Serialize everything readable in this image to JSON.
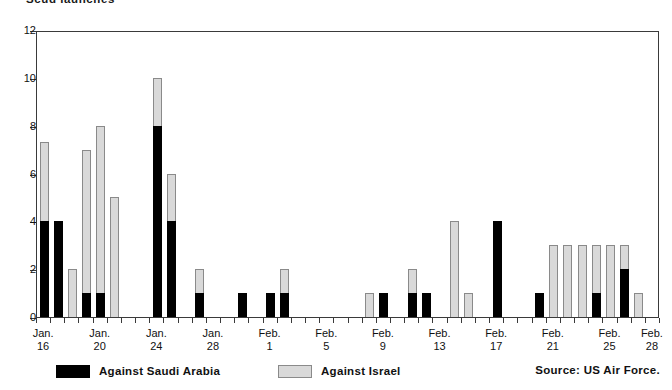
{
  "chart_data": {
    "type": "bar",
    "title": "Scud launches",
    "subtitle": "",
    "xlabel": "",
    "ylabel": "",
    "ylim": [
      0,
      12
    ],
    "ytick_labels": [
      "0",
      "2",
      "4",
      "6",
      "8",
      "10",
      "12"
    ],
    "yticks": [
      0,
      2,
      4,
      6,
      8,
      10,
      12
    ],
    "grid": false,
    "stacked": true,
    "legend_position": "bottom-left",
    "source": "Source: US Air Force.",
    "legend": [
      {
        "name": "Against Saudi Arabia",
        "color": "#000000"
      },
      {
        "name": "Against Israel",
        "color": "#d9d9d9"
      }
    ],
    "categories": [
      "Jan. 16",
      "Jan. 17",
      "Jan. 18",
      "Jan. 19",
      "Jan. 20",
      "Jan. 21",
      "Jan. 22",
      "Jan. 23",
      "Jan. 24",
      "Jan. 25",
      "Jan. 26",
      "Jan. 27",
      "Jan. 28",
      "Jan. 29",
      "Jan. 30",
      "Jan. 31",
      "Feb. 1",
      "Feb. 2",
      "Feb. 3",
      "Feb. 4",
      "Feb. 5",
      "Feb. 6",
      "Feb. 7",
      "Feb. 8",
      "Feb. 9",
      "Feb. 10",
      "Feb. 11",
      "Feb. 12",
      "Feb. 13",
      "Feb. 14",
      "Feb. 15",
      "Feb. 16",
      "Feb. 17",
      "Feb. 18",
      "Feb. 19",
      "Feb. 20",
      "Feb. 21",
      "Feb. 22",
      "Feb. 23",
      "Feb. 24",
      "Feb. 25",
      "Feb. 26",
      "Feb. 27",
      "Feb. 28"
    ],
    "axis_tick_labels": [
      {
        "line1": "Jan.",
        "line2": "16",
        "index": 0
      },
      {
        "line1": "Jan.",
        "line2": "20",
        "index": 4
      },
      {
        "line1": "Jan.",
        "line2": "24",
        "index": 8
      },
      {
        "line1": "Jan.",
        "line2": "28",
        "index": 12
      },
      {
        "line1": "Feb.",
        "line2": "1",
        "index": 16
      },
      {
        "line1": "Feb.",
        "line2": "5",
        "index": 20
      },
      {
        "line1": "Feb.",
        "line2": "9",
        "index": 24
      },
      {
        "line1": "Feb.",
        "line2": "13",
        "index": 28
      },
      {
        "line1": "Feb.",
        "line2": "17",
        "index": 32
      },
      {
        "line1": "Feb.",
        "line2": "21",
        "index": 36
      },
      {
        "line1": "Feb.",
        "line2": "25",
        "index": 40
      },
      {
        "line1": "Feb.",
        "line2": "28",
        "index": 43
      }
    ],
    "series": [
      {
        "name": "Against Saudi Arabia",
        "color": "#000000",
        "values": [
          4,
          4,
          0,
          1,
          1,
          0,
          0,
          0,
          8,
          4,
          0,
          1,
          0,
          0,
          1,
          0,
          1,
          1,
          0,
          0,
          0,
          0,
          0,
          0,
          1,
          0,
          1,
          1,
          0,
          0,
          0,
          0,
          4,
          0,
          0,
          1,
          0,
          0,
          0,
          1,
          0,
          2,
          0,
          0
        ]
      },
      {
        "name": "Against Israel",
        "color": "#d9d9d9",
        "values": [
          3.3,
          0,
          2,
          6,
          7,
          5,
          0,
          0,
          2,
          2,
          0,
          1,
          0,
          0,
          0,
          0,
          0,
          1,
          0,
          0,
          0,
          0,
          0,
          1,
          0,
          0,
          1,
          0,
          0,
          4,
          1,
          0,
          0,
          0,
          0,
          0,
          3,
          3,
          3,
          2,
          3,
          1,
          1,
          0
        ]
      }
    ],
    "totals": [
      7.3,
      4,
      2,
      7,
      8,
      5,
      0,
      0,
      10,
      6,
      0,
      2,
      0,
      0,
      1,
      0,
      1,
      2,
      0,
      0,
      0,
      0,
      0,
      1,
      1,
      0,
      2,
      1,
      0,
      4,
      5,
      0,
      4,
      0,
      0,
      1,
      3,
      3,
      3,
      3,
      3,
      3,
      1,
      0
    ]
  }
}
